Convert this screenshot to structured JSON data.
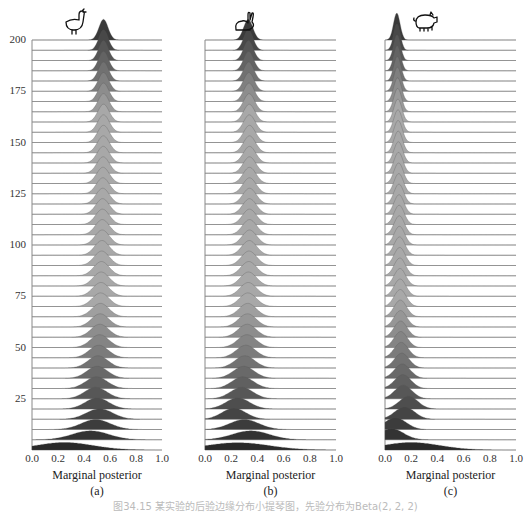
{
  "chart_data": {
    "type": "ridgeline",
    "title": "",
    "xlabel": "Marginal posterior",
    "ylabel": "",
    "xlim": [
      0.0,
      1.0
    ],
    "ylim": [
      0,
      200
    ],
    "x_ticks": [
      "0.0",
      "0.2",
      "0.4",
      "0.6",
      "0.8",
      "1.0"
    ],
    "y_ticks": [
      "25",
      "50",
      "75",
      "100",
      "125",
      "150",
      "175",
      "200"
    ],
    "row_step": 5,
    "rows": 41,
    "panels": [
      {
        "id": "a",
        "sublabel": "(a)",
        "icon": "chicken-icon",
        "start": {
          "mean": 0.25,
          "sd": 0.22
        },
        "end": {
          "mean": 0.55,
          "sd": 0.035
        },
        "early_rows": [
          {
            "row": 0,
            "mean": 0.25,
            "sd": 0.22
          },
          {
            "row": 5,
            "mean": 0.45,
            "sd": 0.14
          },
          {
            "row": 10,
            "mean": 0.49,
            "sd": 0.11
          },
          {
            "row": 15,
            "mean": 0.52,
            "sd": 0.1
          },
          {
            "row": 20,
            "mean": 0.5,
            "sd": 0.09
          },
          {
            "row": 25,
            "mean": 0.49,
            "sd": 0.085
          },
          {
            "row": 50,
            "mean": 0.52,
            "sd": 0.07
          },
          {
            "row": 100,
            "mean": 0.54,
            "sd": 0.055
          },
          {
            "row": 150,
            "mean": 0.55,
            "sd": 0.045
          },
          {
            "row": 200,
            "mean": 0.55,
            "sd": 0.035
          }
        ]
      },
      {
        "id": "b",
        "sublabel": "(b)",
        "icon": "rabbit-icon",
        "early_rows": [
          {
            "row": 0,
            "mean": 0.25,
            "sd": 0.24
          },
          {
            "row": 5,
            "mean": 0.35,
            "sd": 0.14
          },
          {
            "row": 10,
            "mean": 0.3,
            "sd": 0.11
          },
          {
            "row": 15,
            "mean": 0.22,
            "sd": 0.09
          },
          {
            "row": 20,
            "mean": 0.25,
            "sd": 0.09
          },
          {
            "row": 25,
            "mean": 0.28,
            "sd": 0.085
          },
          {
            "row": 50,
            "mean": 0.32,
            "sd": 0.07
          },
          {
            "row": 100,
            "mean": 0.34,
            "sd": 0.055
          },
          {
            "row": 150,
            "mean": 0.34,
            "sd": 0.045
          },
          {
            "row": 200,
            "mean": 0.33,
            "sd": 0.035
          }
        ]
      },
      {
        "id": "c",
        "sublabel": "(c)",
        "icon": "pig-icon",
        "early_rows": [
          {
            "row": 0,
            "mean": 0.2,
            "sd": 0.22
          },
          {
            "row": 5,
            "mean": 0.05,
            "sd": 0.09
          },
          {
            "row": 10,
            "mean": 0.08,
            "sd": 0.08
          },
          {
            "row": 15,
            "mean": 0.15,
            "sd": 0.075
          },
          {
            "row": 20,
            "mean": 0.18,
            "sd": 0.07
          },
          {
            "row": 25,
            "mean": 0.14,
            "sd": 0.065
          },
          {
            "row": 50,
            "mean": 0.12,
            "sd": 0.05
          },
          {
            "row": 100,
            "mean": 0.11,
            "sd": 0.04
          },
          {
            "row": 150,
            "mean": 0.1,
            "sd": 0.032
          },
          {
            "row": 200,
            "mean": 0.09,
            "sd": 0.025
          }
        ]
      }
    ],
    "colors": {
      "early": "#2a2a2a",
      "late": "#a8a8a8",
      "top": "#3a3a3a",
      "baseline": "#c8c8c8",
      "axis": "#888888"
    }
  },
  "caption": "图34.15  某实验的后验边缘分布小提琴图，先验分布为Beta(2, 2, 2)"
}
